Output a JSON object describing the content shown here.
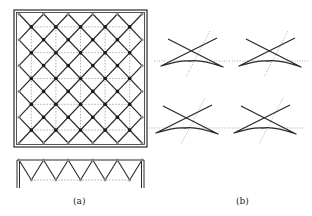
{
  "figure": {
    "panel_a": {
      "label": "(a)",
      "description": "Diagonal grid (diagrid) in square frame with dotted orthogonal grid, plus elevation with zig-zag truss",
      "grid_divisions": 5,
      "frame": {
        "x": 14,
        "y": 10,
        "width": 133,
        "height": 137
      },
      "inner": {
        "x0": 19,
        "y0": 14,
        "x1": 142,
        "y1": 143
      },
      "elevation": {
        "top_y": 160,
        "bottom_y": 180,
        "frame_bottom_y": 188,
        "x0": 19,
        "x1": 142,
        "peaks": 6
      }
    },
    "panel_b": {
      "label": "(b)",
      "description": "Four star-shaped (bow-tie) units with dotted horizontal and inclined axis lines",
      "units": [
        {
          "name": "unit-top-left",
          "cx": 192,
          "cy": 61
        },
        {
          "name": "unit-top-right",
          "cx": 270,
          "cy": 61
        },
        {
          "name": "unit-bottom-left",
          "cx": 187,
          "cy": 128
        },
        {
          "name": "unit-bottom-right",
          "cx": 265,
          "cy": 128
        }
      ]
    }
  },
  "colors": {
    "line": "#2a2a2a",
    "dotted": "#777777",
    "node": "#1a1a1a",
    "edge_node": "#888888"
  }
}
